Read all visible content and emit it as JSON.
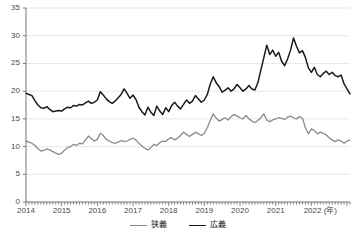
{
  "chart_data": {
    "type": "line",
    "title": "",
    "xlabel": "(年)",
    "ylabel": "",
    "ylim": [
      0,
      35
    ],
    "yticks": [
      0,
      5,
      10,
      15,
      20,
      25,
      30,
      35
    ],
    "xticks": [
      "2014",
      "2015",
      "2016",
      "2017",
      "2018",
      "2019",
      "2020",
      "2021",
      "2022"
    ],
    "x_unit_note": "(年)",
    "grid": "horizontal",
    "legend_position": "bottom-center",
    "tick_interval": "monthly",
    "x_start": "2014-01",
    "x_end": "2022-06",
    "series": [
      {
        "name": "狭義",
        "color": "#8a8a8a",
        "values": [
          11.0,
          10.8,
          10.6,
          10.2,
          9.6,
          9.2,
          9.3,
          9.6,
          9.4,
          9.1,
          8.8,
          8.6,
          8.8,
          9.4,
          9.8,
          10.0,
          10.4,
          10.2,
          10.6,
          10.5,
          11.2,
          11.9,
          11.4,
          11.0,
          11.3,
          12.4,
          12.0,
          11.3,
          11.0,
          10.7,
          10.6,
          10.8,
          11.1,
          10.9,
          11.0,
          11.3,
          11.5,
          11.2,
          10.6,
          10.1,
          9.7,
          9.4,
          9.8,
          10.4,
          10.2,
          10.7,
          11.0,
          10.9,
          11.4,
          11.6,
          11.2,
          11.5,
          12.0,
          12.6,
          12.2,
          11.8,
          12.2,
          12.6,
          12.3,
          12.0,
          12.4,
          13.4,
          14.7,
          15.9,
          15.1,
          14.6,
          14.9,
          15.2,
          14.8,
          15.4,
          15.8,
          15.5,
          15.2,
          15.0,
          15.6,
          15.0,
          14.6,
          14.3,
          14.7,
          15.2,
          15.9,
          14.8,
          14.5,
          14.8,
          15.0,
          15.2,
          15.1,
          14.9,
          15.3,
          15.5,
          15.2,
          15.0,
          15.4,
          15.1,
          13.4,
          12.3,
          13.2,
          12.9,
          12.3,
          12.6,
          12.4,
          12.1,
          11.6,
          11.2,
          10.9,
          11.2,
          11.0,
          10.6,
          11.0,
          11.2
        ]
      },
      {
        "name": "広義",
        "color": "#1a1a1a",
        "values": [
          19.6,
          19.4,
          19.2,
          18.3,
          17.5,
          17.0,
          16.9,
          17.2,
          16.7,
          16.3,
          16.4,
          16.5,
          16.4,
          16.8,
          17.1,
          17.0,
          17.4,
          17.3,
          17.6,
          17.5,
          17.9,
          18.2,
          17.8,
          18.0,
          18.4,
          19.9,
          19.3,
          18.6,
          18.1,
          17.8,
          18.2,
          18.8,
          19.4,
          20.4,
          19.6,
          18.7,
          19.3,
          18.5,
          17.1,
          16.3,
          15.7,
          17.1,
          16.2,
          15.6,
          17.3,
          16.4,
          15.8,
          17.0,
          16.3,
          17.4,
          18.0,
          17.3,
          16.8,
          17.6,
          18.4,
          17.8,
          18.2,
          19.2,
          18.6,
          18.0,
          18.4,
          19.4,
          21.3,
          22.6,
          21.5,
          20.8,
          19.8,
          20.2,
          20.6,
          20.0,
          20.4,
          21.2,
          20.6,
          20.0,
          20.4,
          21.0,
          20.4,
          20.2,
          21.5,
          23.8,
          26.0,
          28.3,
          26.6,
          27.4,
          26.3,
          27.0,
          25.4,
          24.6,
          25.8,
          27.4,
          29.6,
          28.1,
          26.9,
          27.3,
          26.1,
          24.2,
          23.4,
          24.3,
          23.0,
          22.6,
          23.2,
          23.6,
          23.0,
          23.4,
          22.8,
          22.6,
          22.9,
          21.3,
          20.4,
          19.5
        ]
      }
    ]
  },
  "axis": {
    "y_labels": [
      "35",
      "30",
      "25",
      "20",
      "15",
      "10",
      "5",
      "0"
    ],
    "x_labels": [
      "2014",
      "2015",
      "2016",
      "2017",
      "2018",
      "2019",
      "2020",
      "2021",
      "2022"
    ],
    "x_unit": "(年)"
  },
  "legend": {
    "items": [
      {
        "label": "狭義",
        "color": "#8a8a8a"
      },
      {
        "label": "広義",
        "color": "#1a1a1a"
      }
    ]
  }
}
